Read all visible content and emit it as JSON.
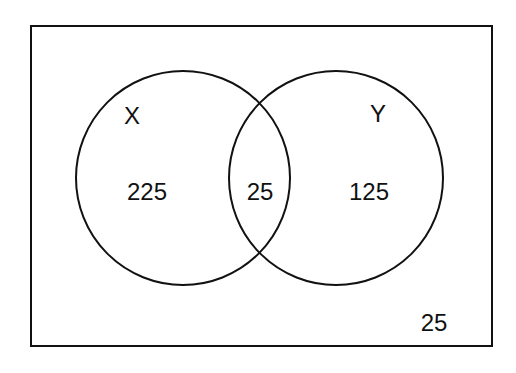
{
  "diagram": {
    "type": "venn",
    "colors": {
      "stroke": "#111111",
      "background": "#ffffff",
      "text": "#111111"
    },
    "universe": {
      "label": "",
      "outside_value": "25"
    },
    "sets": [
      {
        "name": "X",
        "only_value": "225"
      },
      {
        "name": "Y",
        "only_value": "125"
      }
    ],
    "intersection": {
      "sets": [
        "X",
        "Y"
      ],
      "value": "25"
    }
  }
}
